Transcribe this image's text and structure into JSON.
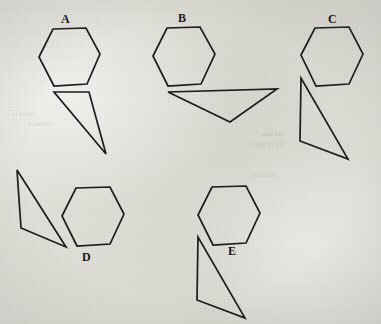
{
  "page": {
    "background_color": "#dcdbd4",
    "ink_color": "#1a1a1e",
    "width": 381,
    "height": 324
  },
  "figures": [
    {
      "id": "A",
      "label": "A",
      "label_x": 61,
      "label_y": 13,
      "hexagon": "39,57 53,29 86,28 100,54 87,84 54,86",
      "triangle": "54,92 89,92 106,154",
      "label_position": "above"
    },
    {
      "id": "B",
      "label": "B",
      "label_x": 178,
      "label_y": 12,
      "hexagon": "153,56 167,28 200,27 215,54 201,84 168,86",
      "triangle": "168,92 277,89 230,122",
      "label_position": "above"
    },
    {
      "id": "C",
      "label": "C",
      "label_x": 328,
      "label_y": 13,
      "hexagon": "301,55 315,28 349,27 363,54 349,84 316,86",
      "triangle": "301,78 300,141 348,159",
      "label_position": "above"
    },
    {
      "id": "D",
      "label": "D",
      "label_x": 82,
      "label_y": 251,
      "hexagon": "62,216 76,188 110,187 124,214 110,244 77,246",
      "triangle": "17,170 21,228 66,247",
      "label_position": "below"
    },
    {
      "id": "E",
      "label": "E",
      "label_x": 228,
      "label_y": 245,
      "hexagon": "198,215 212,187 246,186 260,213 246,243 213,245",
      "triangle": "198,237 197,300 245,318",
      "label_position": "below"
    }
  ],
  "bleed_through": [
    {
      "text": "eranigi",
      "x": 12,
      "y": 110,
      "size": 7,
      "rot": -1.2,
      "faint": true
    },
    {
      "text": "lsumeno",
      "x": 28,
      "y": 120,
      "size": 7,
      "rot": -1.0,
      "faint": true
    },
    {
      "text": "sab eur",
      "x": 262,
      "y": 130,
      "size": 7,
      "rot": -0.8,
      "faint": false
    },
    {
      "text": "subukses ras",
      "x": 250,
      "y": 141,
      "size": 6,
      "rot": -0.8,
      "faint": true
    },
    {
      "text": "ensunure",
      "x": 252,
      "y": 172,
      "size": 6,
      "rot": -0.6,
      "faint": true
    }
  ]
}
